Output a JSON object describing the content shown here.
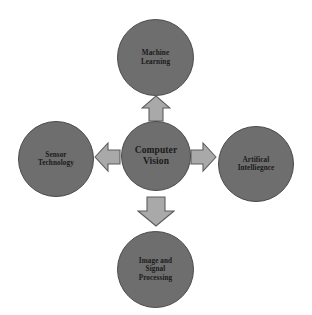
{
  "diagram": {
    "type": "hub-and-spoke",
    "background_color": "#ffffff",
    "node_color": "#6e6e6e",
    "node_border_color": "#4a4a4a",
    "arrow_color": "#a9a9a9",
    "arrow_border_color": "#5d5d5d",
    "text_color": "#1a1a1a",
    "center": {
      "label": "Computer\nVision",
      "name": "computer-vision"
    },
    "nodes": [
      {
        "label": "Machine\nLearning",
        "name": "machine-learning",
        "position": "top"
      },
      {
        "label": "Artifical\nIntelliegnce",
        "name": "artificial-intelligence",
        "position": "right"
      },
      {
        "label": "Image and\nSignal\nProcessing",
        "name": "image-and-signal-processing",
        "position": "bottom"
      },
      {
        "label": "Sensor\nTechnology",
        "name": "sensor-technology",
        "position": "left"
      }
    ],
    "arrows": [
      {
        "name": "arrow-up",
        "direction": "up",
        "from": "computer-vision",
        "to": "machine-learning"
      },
      {
        "name": "arrow-right",
        "direction": "right",
        "from": "computer-vision",
        "to": "artificial-intelligence"
      },
      {
        "name": "arrow-down",
        "direction": "down",
        "from": "computer-vision",
        "to": "image-and-signal-processing"
      },
      {
        "name": "arrow-left",
        "direction": "left",
        "from": "computer-vision",
        "to": "sensor-technology"
      }
    ]
  }
}
